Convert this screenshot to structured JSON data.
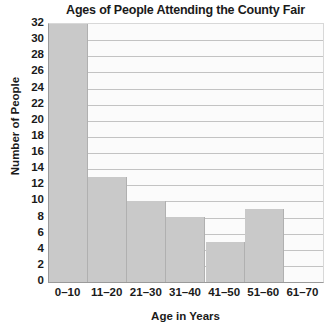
{
  "chart_data": {
    "type": "bar",
    "title": "Ages of People Attending the County Fair",
    "xlabel": "Age in Years",
    "ylabel": "Number of People",
    "categories": [
      "0–10",
      "11–20",
      "21–30",
      "31–40",
      "41–50",
      "51–60",
      "61–70"
    ],
    "values": [
      32,
      13,
      10,
      8,
      5,
      9,
      0
    ],
    "ylim": [
      0,
      32
    ],
    "ytick_step": 2,
    "yticks": [
      32,
      30,
      28,
      26,
      24,
      22,
      20,
      18,
      16,
      14,
      12,
      10,
      8,
      6,
      4,
      2,
      0
    ],
    "grid": "horizontal",
    "legend": "none",
    "colors": {
      "bar_fill": "#c9c9c9",
      "bar_edge": "#b0b0b0",
      "gridline": "#c3c3c3",
      "axis": "#9a9a9a",
      "plot_background": "#fbfbfb",
      "text": "#1a1a1a"
    }
  }
}
